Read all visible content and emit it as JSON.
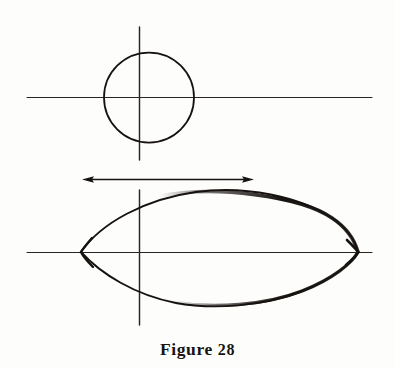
{
  "page": {
    "background_color": "#fdfdfc",
    "ink_color": "#16120f",
    "width": 395,
    "height": 368
  },
  "caption": {
    "label": "Figure 28",
    "word": "Figure",
    "number": "28"
  },
  "figure": {
    "elements": [
      {
        "name": "upper-horizontal-axis",
        "type": "line",
        "x1": 27,
        "y1": 97,
        "x2": 372,
        "y2": 97,
        "stroke_width": 1.1
      },
      {
        "name": "upper-vertical-axis",
        "type": "line",
        "x1": 139,
        "y1": 27,
        "x2": 139,
        "y2": 160,
        "stroke_width": 1.3
      },
      {
        "name": "circle",
        "type": "circle",
        "cx": 149,
        "cy": 97,
        "r": 45,
        "stroke_width": 1.6
      },
      {
        "name": "dimension-arrow",
        "type": "double-arrow",
        "x1": 84,
        "y1": 179,
        "x2": 252,
        "y2": 179,
        "stroke_width": 1.4,
        "head_length": 9,
        "head_width": 5
      },
      {
        "name": "lower-horizontal-axis",
        "type": "line",
        "x1": 27,
        "y1": 252,
        "x2": 372,
        "y2": 252,
        "stroke_width": 1.1
      },
      {
        "name": "lower-vertical-axis",
        "type": "line",
        "x1": 139,
        "y1": 190,
        "x2": 139,
        "y2": 325,
        "stroke_width": 1.3
      },
      {
        "name": "cusped-oval",
        "type": "closed-curve",
        "left_cusp": [
          81,
          252
        ],
        "right_cusp": [
          358,
          252
        ],
        "top_apex": [
          243,
          191
        ],
        "bottom_apex": [
          228,
          305
        ],
        "stroke_width": 2.4,
        "thick_stroke_width": 4.0
      }
    ]
  }
}
